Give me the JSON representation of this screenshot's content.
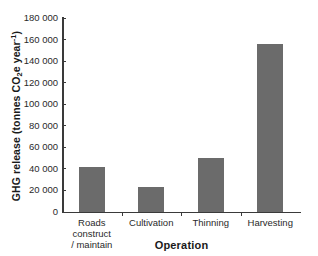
{
  "chart_data": {
    "type": "bar",
    "title": "",
    "xlabel": "Operation",
    "ylabel": "GHG release (tonnes CO2e year-1)",
    "ylabel_parts": {
      "lead": "GHG release (tonnes CO",
      "sub": "2",
      "mid": "e year",
      "sup": "-1",
      "tail": ")"
    },
    "categories": [
      "Roads construct / maintain",
      "Cultivation",
      "Thinning",
      "Harvesting"
    ],
    "category_lines": [
      [
        "Roads construct",
        "/ maintain"
      ],
      [
        "Cultivation"
      ],
      [
        "Thinning"
      ],
      [
        "Harvesting"
      ]
    ],
    "values": [
      42000,
      23000,
      50000,
      155500
    ],
    "ylim": [
      0,
      180000
    ],
    "ytick_step": 20000,
    "ytick_labels": [
      "180 000",
      "160 000",
      "140 000",
      "120 000",
      "100 000",
      "80 000",
      "60 000",
      "40 000",
      "20 000",
      "0"
    ],
    "ytick_values": [
      180000,
      160000,
      140000,
      120000,
      100000,
      80000,
      60000,
      40000,
      20000,
      0
    ],
    "grid": false,
    "legend": null,
    "bar_color": "#6b6b6b",
    "axis_color": "#3a3a3a",
    "background": "#ffffff"
  }
}
